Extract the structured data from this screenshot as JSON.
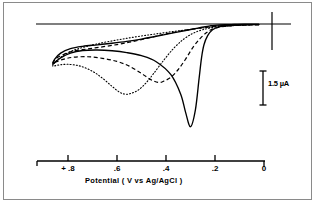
{
  "figure": {
    "kind": "cyclic-voltammogram",
    "background": "#ffffff",
    "frame_color": "#8a8a8a",
    "line_color": "#000000"
  },
  "scalebar": {
    "label": "1.5 µA",
    "value": 1.5,
    "units": "µA"
  },
  "axis": {
    "title_parts": {
      "name": "Potential",
      "open_paren": "(",
      "unit": "V",
      "vs": "vs",
      "reference": "Ag/AgCl",
      "close_paren": ")"
    },
    "title_full": "Potential  ( V  vs  Ag/AgCl )",
    "tick_labels": [
      "+  .8",
      ".6",
      ".4",
      ".2",
      "0"
    ],
    "tick_values": [
      0.8,
      0.6,
      0.4,
      0.2,
      0.0
    ],
    "direction_note": "positive to left"
  },
  "chart_data": {
    "type": "line",
    "title": "",
    "xlabel": "Potential  ( V  vs  Ag/AgCl )",
    "ylabel": "Current",
    "xlim": [
      0.88,
      -0.04
    ],
    "ylim": [
      -4.6,
      0.55
    ],
    "grid": false,
    "legend": "none",
    "scalebar": {
      "length_units": 1.5,
      "label": "1.5 µA"
    },
    "axis_ticks": [
      0.8,
      0.6,
      0.4,
      0.2,
      0.0
    ],
    "baseline_current": 0,
    "series": [
      {
        "name": "solid-curve",
        "style": "solid",
        "cathodic_peak": {
          "potential": 0.29,
          "current": -3.95
        },
        "anodic_shoulder": {
          "potential": 0.74,
          "current": -1.05
        },
        "switching_potentials": [
          0.86,
          0.02
        ],
        "x": [
          0.02,
          0.06,
          0.1,
          0.14,
          0.18,
          0.21,
          0.23,
          0.245,
          0.255,
          0.265,
          0.28,
          0.3,
          0.32,
          0.34,
          0.38,
          0.44,
          0.5,
          0.56,
          0.62,
          0.68,
          0.74,
          0.79,
          0.83,
          0.855,
          0.862,
          0.855,
          0.83,
          0.79,
          0.74,
          0.68,
          0.62,
          0.56,
          0.5,
          0.44,
          0.38,
          0.32,
          0.27,
          0.24,
          0.22,
          0.2,
          0.16,
          0.12,
          0.08,
          0.04,
          0.02
        ],
        "y": [
          -0.02,
          -0.03,
          -0.04,
          -0.06,
          -0.1,
          -0.22,
          -0.45,
          -0.8,
          -1.3,
          -2.1,
          -3.3,
          -3.95,
          -3.4,
          -2.7,
          -1.95,
          -1.45,
          -1.22,
          -1.1,
          -1.03,
          -1.0,
          -1.02,
          -1.12,
          -1.3,
          -1.48,
          -1.55,
          -1.36,
          -1.12,
          -0.95,
          -0.86,
          -0.8,
          -0.74,
          -0.67,
          -0.58,
          -0.47,
          -0.36,
          -0.25,
          -0.16,
          -0.1,
          -0.07,
          -0.05,
          -0.03,
          -0.02,
          -0.01,
          -0.01,
          -0.01
        ]
      },
      {
        "name": "dashed-curve",
        "style": "dashed",
        "cathodic_peak": {
          "potential": 0.43,
          "current": -2.25
        },
        "switching_potentials": [
          0.86,
          0.02
        ],
        "x": [
          0.02,
          0.07,
          0.12,
          0.16,
          0.2,
          0.23,
          0.26,
          0.29,
          0.32,
          0.35,
          0.38,
          0.41,
          0.43,
          0.46,
          0.5,
          0.55,
          0.6,
          0.66,
          0.72,
          0.78,
          0.82,
          0.85,
          0.862,
          0.85,
          0.82,
          0.78,
          0.72,
          0.66,
          0.6,
          0.55,
          0.5,
          0.45,
          0.4,
          0.34,
          0.28,
          0.23,
          0.19,
          0.15,
          0.1,
          0.05,
          0.02
        ],
        "y": [
          -0.03,
          -0.04,
          -0.06,
          -0.09,
          -0.16,
          -0.3,
          -0.55,
          -0.9,
          -1.35,
          -1.75,
          -2.05,
          -2.2,
          -2.25,
          -2.15,
          -1.9,
          -1.62,
          -1.44,
          -1.32,
          -1.26,
          -1.28,
          -1.36,
          -1.46,
          -1.52,
          -1.34,
          -1.18,
          -1.05,
          -0.96,
          -0.88,
          -0.79,
          -0.7,
          -0.6,
          -0.49,
          -0.38,
          -0.27,
          -0.18,
          -0.12,
          -0.08,
          -0.05,
          -0.03,
          -0.02,
          -0.02
        ]
      },
      {
        "name": "dotted-curve",
        "style": "dotted",
        "cathodic_peak": {
          "potential": 0.565,
          "current": -2.7
        },
        "switching_potentials": [
          0.86,
          0.02
        ],
        "x": [
          0.02,
          0.08,
          0.14,
          0.2,
          0.25,
          0.29,
          0.33,
          0.37,
          0.41,
          0.45,
          0.48,
          0.51,
          0.54,
          0.565,
          0.59,
          0.62,
          0.66,
          0.7,
          0.75,
          0.8,
          0.84,
          0.862,
          0.85,
          0.82,
          0.78,
          0.73,
          0.68,
          0.62,
          0.56,
          0.5,
          0.44,
          0.38,
          0.32,
          0.26,
          0.21,
          0.16,
          0.11,
          0.06,
          0.02
        ],
        "y": [
          -0.02,
          -0.04,
          -0.07,
          -0.12,
          -0.22,
          -0.36,
          -0.6,
          -0.95,
          -1.4,
          -1.9,
          -2.25,
          -2.52,
          -2.66,
          -2.7,
          -2.62,
          -2.4,
          -2.08,
          -1.82,
          -1.62,
          -1.55,
          -1.58,
          -1.62,
          -1.45,
          -1.22,
          -1.02,
          -0.88,
          -0.76,
          -0.65,
          -0.55,
          -0.46,
          -0.38,
          -0.3,
          -0.23,
          -0.16,
          -0.11,
          -0.07,
          -0.04,
          -0.02,
          -0.02
        ]
      }
    ]
  }
}
